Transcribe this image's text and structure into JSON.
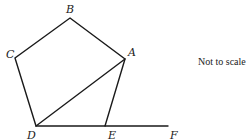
{
  "diagram": {
    "vertices": {
      "A": {
        "label": "A"
      },
      "B": {
        "label": "B"
      },
      "C": {
        "label": "C"
      },
      "D": {
        "label": "D"
      },
      "E": {
        "label": "E"
      },
      "F": {
        "label": "F"
      }
    },
    "note": "Not to scale",
    "shape": "pentagon ABCDE with diagonal AD and line DE extended to F"
  }
}
